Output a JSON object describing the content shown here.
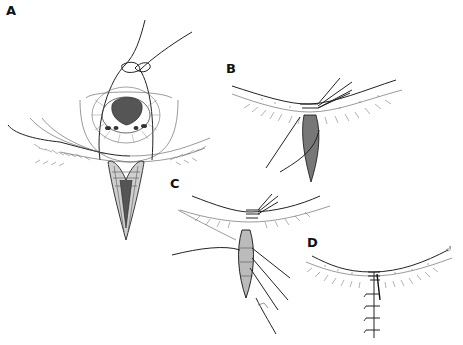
{
  "figure": {
    "type": "medical illustration",
    "panels": [
      {
        "id": "A",
        "label": "A",
        "description": "upper eyelid everted by suture traction with full-thickness V-shaped lower lid defect below cornea"
      },
      {
        "id": "B",
        "label": "B",
        "description": "marginal sutures placed at lid margin above closed wedge"
      },
      {
        "id": "C",
        "label": "C",
        "description": "tarsal closure with interrupted sutures"
      },
      {
        "id": "D",
        "label": "D",
        "description": "completed skin closure with interrupted sutures"
      }
    ]
  }
}
